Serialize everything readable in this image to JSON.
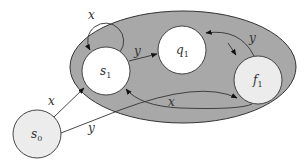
{
  "diagram": {
    "type": "state-transition-automaton",
    "region": {
      "fill": "#a8a8a8",
      "stroke": "#333333"
    },
    "nodes": [
      {
        "id": "s0",
        "base": "s",
        "sub": "0",
        "fill": "#ececec"
      },
      {
        "id": "s1",
        "base": "s",
        "sub": "1",
        "fill": "#ffffff"
      },
      {
        "id": "q1",
        "base": "q",
        "sub": "1",
        "fill": "#ffffff"
      },
      {
        "id": "f1",
        "base": "f",
        "sub": "1",
        "fill": "#ececec"
      }
    ],
    "edges": [
      {
        "from": "s1",
        "to": "s1",
        "label": "x"
      },
      {
        "from": "s1",
        "to": "q1",
        "label": "y"
      },
      {
        "from": "f1",
        "to": "q1",
        "label": "y"
      },
      {
        "from": "q1",
        "to": "f1",
        "label": ""
      },
      {
        "from": "f1",
        "to": "s1",
        "label": "x"
      },
      {
        "from": "s0",
        "to": "s1",
        "label": "x"
      },
      {
        "from": "s0",
        "to": "f1",
        "label": "y"
      }
    ],
    "labels": {
      "loop_s1": "x",
      "s1_q1": "y",
      "f1_q1": "y",
      "f1_s1": "x",
      "s0_s1": "x",
      "s0_f1": "y"
    },
    "node_labels": {
      "s0": {
        "base": "s",
        "sub": "0"
      },
      "s1": {
        "base": "s",
        "sub": "1"
      },
      "q1": {
        "base": "q",
        "sub": "1"
      },
      "f1": {
        "base": "f",
        "sub": "1"
      }
    }
  }
}
